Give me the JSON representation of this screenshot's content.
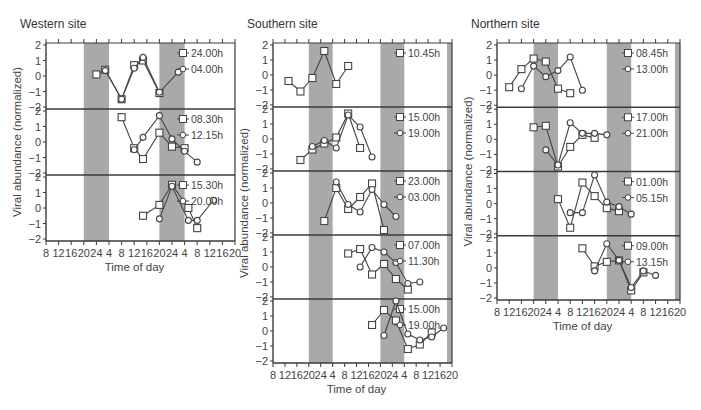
{
  "chart_data": {
    "type": "line",
    "title": "",
    "xlabel": "Time of day",
    "ylabel": "Viral abundance (normalized)",
    "x_tick_labels": [
      "8",
      "12",
      "16",
      "20",
      "24",
      "4",
      "8",
      "12",
      "16",
      "20",
      "24",
      "4",
      "8",
      "12",
      "16",
      "20"
    ],
    "y_tick_labels": [
      "2",
      "1",
      "0",
      "−1",
      "−2"
    ],
    "ylim": [
      -2,
      2
    ],
    "shading": "gray bands mark night (20h–4h)",
    "shaded_tick_ranges": [
      [
        3,
        5
      ],
      [
        9,
        11
      ],
      [
        15,
        15.5
      ]
    ],
    "note": "x values are tick indices (0 = 8h on day 1, each step = 4h)",
    "sites": [
      {
        "name": "Western site",
        "frame": {
          "left": 46,
          "right": 235,
          "top": 43,
          "bottom": 241
        },
        "right_band": false,
        "panels": [
          {
            "series": [
              {
                "name": "24.00h",
                "marker": "square",
                "x": [
                  4,
                  4.7,
                  6,
                  7,
                  7.7,
                  9,
                  10.5
                ],
                "y": [
                  0.1,
                  0.4,
                  -1.5,
                  0.7,
                  1.0,
                  -1.1,
                  null
                ]
              },
              {
                "name": "04.00h",
                "marker": "diamond",
                "x": [
                  4.7,
                  6,
                  7,
                  7.7,
                  9,
                  10.5
                ],
                "y": [
                  0.35,
                  -1.5,
                  0.5,
                  1.2,
                  -1.05,
                  0.25
                ]
              }
            ]
          },
          {
            "series": [
              {
                "name": "08.30h",
                "marker": "square",
                "x": [
                  6,
                  7,
                  7.7,
                  9,
                  10,
                  11
                ],
                "y": [
                  1.6,
                  -0.4,
                  -1.1,
                  0.6,
                  -0.3,
                  -0.4
                ]
              },
              {
                "name": "12.15h",
                "marker": "diamond",
                "x": [
                  7,
                  7.7,
                  9,
                  10,
                  11,
                  12
                ],
                "y": [
                  -0.5,
                  0.3,
                  1.7,
                  0.2,
                  -0.6,
                  -1.3
                ]
              }
            ]
          },
          {
            "series": [
              {
                "name": "15.30h",
                "marker": "square",
                "x": [
                  7.7,
                  9,
                  10,
                  11.3,
                  12
                ],
                "y": [
                  -0.5,
                  0.2,
                  1.5,
                  0.0,
                  -1.3
                ]
              },
              {
                "name": "20.00h",
                "marker": "diamond",
                "x": [
                  9,
                  10,
                  11.3,
                  12,
                  13.3
                ],
                "y": [
                  -0.7,
                  1.4,
                  -0.8,
                  -0.8,
                  0.5
                ]
              }
            ]
          }
        ]
      },
      {
        "name": "Southern site",
        "frame": {
          "left": 273,
          "right": 452,
          "top": 43,
          "bottom": 363
        },
        "right_band": true,
        "panels": [
          {
            "series": [
              {
                "name": "10.45h",
                "marker": "square",
                "x": [
                  1.3,
                  2.3,
                  3.3,
                  4.3,
                  5.3,
                  6.3
                ],
                "y": [
                  -0.4,
                  -1.1,
                  -0.2,
                  1.6,
                  -0.6,
                  0.6
                ]
              }
            ]
          },
          {
            "series": [
              {
                "name": "15.00h",
                "marker": "square",
                "x": [
                  2.3,
                  3.3,
                  4.3,
                  5.3,
                  6.3,
                  7.3
                ],
                "y": [
                  -1.4,
                  -0.7,
                  -0.3,
                  0.1,
                  1.7,
                  -0.6
                ]
              },
              {
                "name": "19.00h",
                "marker": "diamond",
                "x": [
                  3.3,
                  4.3,
                  5.3,
                  6.3,
                  7.3,
                  8.3
                ],
                "y": [
                  -0.5,
                  -0.1,
                  -0.6,
                  1.6,
                  0.8,
                  -1.2
                ]
              }
            ]
          },
          {
            "series": [
              {
                "name": "23.00h",
                "marker": "square",
                "x": [
                  4.3,
                  5.3,
                  6.3,
                  7.3,
                  8.3,
                  9.3
                ],
                "y": [
                  -1.2,
                  1.0,
                  -0.4,
                  0.4,
                  1.3,
                  -1.8
                ]
              },
              {
                "name": "03.00h",
                "marker": "diamond",
                "x": [
                  5.3,
                  6.3,
                  7.3,
                  8.3,
                  9.3,
                  10.3
                ],
                "y": [
                  1.4,
                  -0.1,
                  -0.6,
                  0.9,
                  -0.1,
                  -0.9
                ]
              }
            ]
          },
          {
            "series": [
              {
                "name": "07.00h",
                "marker": "square",
                "x": [
                  6.3,
                  7.3,
                  8.3,
                  9.3,
                  10.3,
                  11.3
                ],
                "y": [
                  0.9,
                  1.2,
                  -0.5,
                  0.2,
                  -0.8,
                  -1.5
                ]
              },
              {
                "name": "11.30h",
                "marker": "diamond",
                "x": [
                  7.3,
                  8.3,
                  9.3,
                  10.3,
                  11.3,
                  12.3
                ],
                "y": [
                  0.0,
                  1.3,
                  1.0,
                  0.3,
                  -1.1,
                  -1.0
                ]
              }
            ]
          },
          {
            "series": [
              {
                "name": "15.00h",
                "marker": "square",
                "x": [
                  8.3,
                  9.3,
                  10.3,
                  11.3,
                  12.3,
                  13.3
                ],
                "y": [
                  0.4,
                  1.4,
                  0.7,
                  -1.2,
                  -0.9,
                  -0.1
                ]
              },
              {
                "name": "19.00h",
                "marker": "diamond",
                "x": [
                  9.3,
                  10.3,
                  11.3,
                  12.3,
                  13.3,
                  14.3
                ],
                "y": [
                  -0.3,
                  2.0,
                  -0.2,
                  -0.6,
                  -0.4,
                  0.2
                ]
              }
            ]
          }
        ]
      },
      {
        "name": "Northern site",
        "frame": {
          "left": 497,
          "right": 680,
          "top": 43,
          "bottom": 300
        },
        "right_band": true,
        "panels": [
          {
            "series": [
              {
                "name": "08.45h",
                "marker": "square",
                "x": [
                  1,
                  2,
                  3,
                  4,
                  5,
                  6
                ],
                "y": [
                  -0.8,
                  0.4,
                  1.1,
                  0.9,
                  -0.9,
                  -1.2
                ]
              },
              {
                "name": "13.00h",
                "marker": "diamond",
                "x": [
                  2,
                  3,
                  4,
                  5,
                  6,
                  7
                ],
                "y": [
                  -0.9,
                  0.6,
                  -0.1,
                  0.3,
                  1.2,
                  -1.0
                ]
              }
            ]
          },
          {
            "series": [
              {
                "name": "17.00h",
                "marker": "square",
                "x": [
                  3,
                  4,
                  5,
                  6,
                  7,
                  8
                ],
                "y": [
                  0.8,
                  0.9,
                  -1.8,
                  -0.5,
                  0.3,
                  0.1
                ]
              },
              {
                "name": "21.00h",
                "marker": "diamond",
                "x": [
                  4,
                  5,
                  6,
                  7,
                  8,
                  9
                ],
                "y": [
                  -0.7,
                  -1.7,
                  1.1,
                  0.4,
                  0.4,
                  0.3
                ]
              }
            ]
          },
          {
            "series": [
              {
                "name": "01.00h",
                "marker": "square",
                "x": [
                  5,
                  6,
                  7,
                  8,
                  9,
                  10
                ],
                "y": [
                  0.3,
                  -1.6,
                  1.4,
                  0.5,
                  -0.3,
                  -0.5
                ]
              },
              {
                "name": "05.15h",
                "marker": "diamond",
                "x": [
                  6,
                  7,
                  8,
                  9,
                  10,
                  11
                ],
                "y": [
                  -0.6,
                  -0.6,
                  1.9,
                  0.1,
                  -0.2,
                  -0.7
                ]
              }
            ]
          },
          {
            "series": [
              {
                "name": "09.00h",
                "marker": "square",
                "x": [
                  7,
                  8,
                  9,
                  10,
                  11,
                  12
                ],
                "y": [
                  1.3,
                  0.1,
                  0.4,
                  0.5,
                  -1.5,
                  -0.3
                ]
              },
              {
                "name": "13.15h",
                "marker": "diamond",
                "x": [
                  8,
                  9,
                  10,
                  11,
                  12,
                  13
                ],
                "y": [
                  -0.2,
                  1.6,
                  0.5,
                  -1.3,
                  -0.2,
                  -0.5
                ]
              }
            ]
          }
        ]
      }
    ]
  }
}
